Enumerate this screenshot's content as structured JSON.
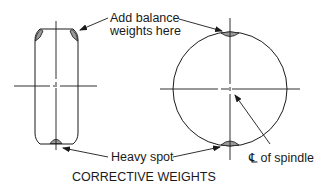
{
  "diagram": {
    "title": "CORRECTIVE WEIGHTS",
    "labels": {
      "add_weights_line1": "Add balance",
      "add_weights_line2": "weights here",
      "heavy_spot": "Heavy spot",
      "spindle_center": "℄ of spindle"
    },
    "views": [
      "side-view-wheel",
      "front-view-wheel"
    ],
    "colors": {
      "line": "#1a1a1a",
      "weight_fill": "#9a9a9a",
      "background": "#ffffff"
    }
  }
}
